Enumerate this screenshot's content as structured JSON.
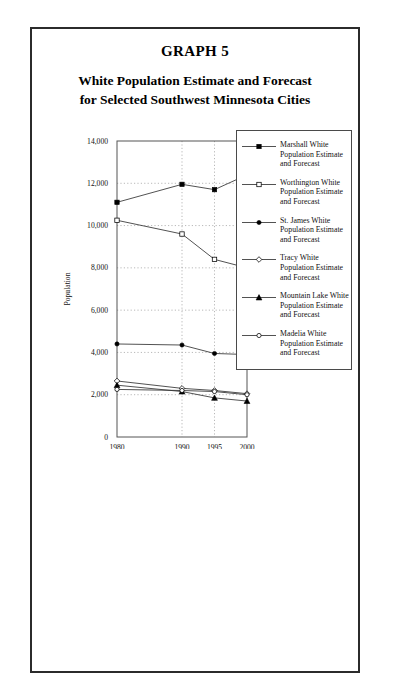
{
  "page": {
    "graph_label": "GRAPH 5",
    "title_line1": "White Population Estimate and Forecast",
    "title_line2": "for Selected Southwest Minnesota Cities"
  },
  "chart_data": {
    "type": "line",
    "title": "White Population Estimate and Forecast for Selected Southwest Minnesota Cities",
    "xlabel": "Year",
    "ylabel": "Population",
    "categories": [
      "1980",
      "1990",
      "1995",
      "2000"
    ],
    "x": [
      1980,
      1990,
      1995,
      2000
    ],
    "ylim": [
      0,
      14000
    ],
    "ytick_labels": [
      "0",
      "2,000",
      "4,000",
      "6,000",
      "8,000",
      "10,000",
      "12,000",
      "14,000"
    ],
    "ytick_values": [
      0,
      2000,
      4000,
      6000,
      8000,
      10000,
      12000,
      14000
    ],
    "grid": "horizontal-and-vertical-dotted",
    "legend_position": "right-outside",
    "series": [
      {
        "name": "Marshall White Population Estimate and Forecast",
        "legend_line1": "Marshall White",
        "legend_line2": "Population Estimate",
        "legend_line3": "and Forecast",
        "marker": "filled-square",
        "values": [
          11100,
          11950,
          11700,
          12400
        ]
      },
      {
        "name": "Worthington White Population Estimate and Forecast",
        "legend_line1": "Worthington White",
        "legend_line2": "Population Estimate",
        "legend_line3": "and Forecast",
        "marker": "open-square",
        "values": [
          10250,
          9600,
          8400,
          8000
        ]
      },
      {
        "name": "St. James White Population Estimate and Forecast",
        "legend_line1": "St. James White",
        "legend_line2": "Population Estimate",
        "legend_line3": "and Forecast",
        "marker": "filled-circle",
        "values": [
          4400,
          4350,
          3950,
          3900
        ]
      },
      {
        "name": "Tracy White Population Estimate and Forecast",
        "legend_line1": "Tracy White",
        "legend_line2": "Population Estimate",
        "legend_line3": "and Forecast",
        "marker": "open-diamond",
        "values": [
          2650,
          2300,
          2200,
          2050
        ]
      },
      {
        "name": "Mountain Lake White Population Estimate and Forecast",
        "legend_line1": "Mountain Lake White",
        "legend_line2": "Population Estimate",
        "legend_line3": "and Forecast",
        "marker": "filled-triangle",
        "values": [
          2450,
          2150,
          1850,
          1700
        ]
      },
      {
        "name": "Madelia White Population Estimate and Forecast",
        "legend_line1": "Madelia White",
        "legend_line2": "Population Estimate",
        "legend_line3": "and Forecast",
        "marker": "open-circle",
        "values": [
          2250,
          2200,
          2150,
          2000
        ]
      }
    ]
  }
}
